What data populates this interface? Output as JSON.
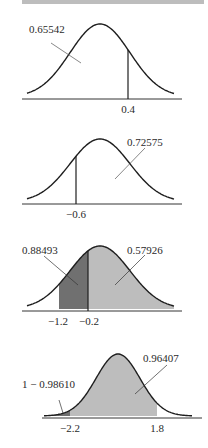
{
  "colors": {
    "ink": "#1e1e1e",
    "dark_shade": "#707070",
    "light_shade": "#bdbdbd",
    "top_bar": "#bdbdbd"
  },
  "chart_data": [
    {
      "type": "area",
      "title": "",
      "description": "Standard normal curve, area left of z = 0.4",
      "x_ticks": [
        "0.4"
      ],
      "annotations": [
        {
          "text": "0.65542",
          "points_to": "area left of 0.4"
        }
      ],
      "cutoffs": [
        0.4
      ],
      "shaded": []
    },
    {
      "type": "area",
      "title": "",
      "description": "Standard normal curve, area right of z = -0.6",
      "x_ticks": [
        "−0.6"
      ],
      "annotations": [
        {
          "text": "0.72575",
          "points_to": "area right of -0.6"
        }
      ],
      "cutoffs": [
        -0.6
      ],
      "shaded": []
    },
    {
      "type": "area",
      "title": "",
      "description": "Standard normal curve, areas right of -1.2 and right of -0.2",
      "x_ticks": [
        "−1.2",
        "−0.2"
      ],
      "annotations": [
        {
          "text": "0.88493",
          "points_to": "area right of -1.2 (dark band -1.2 to -0.2)"
        },
        {
          "text": "0.57926",
          "points_to": "area right of -0.2"
        }
      ],
      "cutoffs": [
        -1.2,
        -0.2
      ],
      "shaded": [
        {
          "from": -1.2,
          "to": -0.2,
          "tone": "dark"
        },
        {
          "from": -0.2,
          "to": "inf",
          "tone": "light"
        }
      ]
    },
    {
      "type": "area",
      "title": "",
      "description": "Standard normal curve, area between -2.2 and 1.8",
      "x_ticks": [
        "−2.2",
        "1.8"
      ],
      "annotations": [
        {
          "text": "1 − 0.98610",
          "points_to": "left tail below -2.2"
        },
        {
          "text": "0.96407",
          "points_to": "area left of 1.8"
        }
      ],
      "cutoffs": [
        -2.2,
        1.8
      ],
      "shaded": [
        {
          "from": "-inf",
          "to": -2.2,
          "tone": "dark"
        },
        {
          "from": -2.2,
          "to": 1.8,
          "tone": "light"
        }
      ]
    }
  ],
  "charts": [
    {
      "label": "0.65542",
      "tick": "0.4"
    },
    {
      "label": "0.72575",
      "tick": "−0.6"
    },
    {
      "label_left": "0.88493",
      "label_right": "0.57926",
      "tick_left": "−1.2",
      "tick_right": "−0.2"
    },
    {
      "label_left": "1 − 0.98610",
      "label_right": "0.96407",
      "tick_left": "−2.2",
      "tick_right": "1.8"
    }
  ]
}
